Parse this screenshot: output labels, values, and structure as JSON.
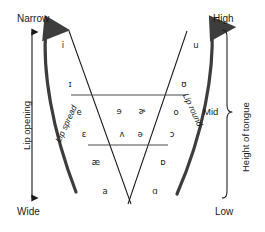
{
  "diagram": {
    "corner_labels": {
      "top_left": "Narrow",
      "bottom_left": "Wide",
      "top_right": "High",
      "bottom_right": "Low"
    },
    "axis_labels": {
      "left": "Lip opening",
      "right": "Height of tongue"
    },
    "band_labels": {
      "mid": "Mid"
    },
    "curve_labels": {
      "left": "Lip spread",
      "right": "Lip round"
    },
    "colors": {
      "stroke": "#1a1a1a",
      "thick_curve": "#3d3d3d",
      "divider": "#4a4a4a",
      "background": "#ffffff",
      "text": "#1a1a1a"
    },
    "vowels": [
      {
        "symbol": "i",
        "name": "close-front-unrounded",
        "x": 63,
        "y": 45
      },
      {
        "symbol": "u",
        "name": "close-back-rounded",
        "x": 196,
        "y": 45
      },
      {
        "symbol": "ɪ",
        "name": "near-close-front-unrounded",
        "x": 70,
        "y": 84
      },
      {
        "symbol": "ʊ",
        "name": "near-close-back-rounded",
        "x": 184,
        "y": 84
      },
      {
        "symbol": "e",
        "name": "close-mid-front-unrounded",
        "x": 79,
        "y": 112
      },
      {
        "symbol": "ɘ",
        "name": "close-mid-central-unrounded",
        "x": 119,
        "y": 111
      },
      {
        "symbol": "ɚ",
        "name": "mid-central-r-colored",
        "x": 142,
        "y": 111
      },
      {
        "symbol": "o",
        "name": "close-mid-back-rounded",
        "x": 176,
        "y": 112
      },
      {
        "symbol": "ɛ",
        "name": "open-mid-front-unrounded",
        "x": 84,
        "y": 134
      },
      {
        "symbol": "ʌ",
        "name": "open-mid-back-unrounded",
        "x": 122,
        "y": 134
      },
      {
        "symbol": "ə",
        "name": "mid-central-schwa",
        "x": 140,
        "y": 134
      },
      {
        "symbol": "ɔ",
        "name": "open-mid-back-rounded",
        "x": 172,
        "y": 134
      },
      {
        "symbol": "æ",
        "name": "near-open-front-unrounded",
        "x": 96,
        "y": 162
      },
      {
        "symbol": "ɒ",
        "name": "open-back-rounded",
        "x": 163,
        "y": 162
      },
      {
        "symbol": "a",
        "name": "open-front-unrounded",
        "x": 105,
        "y": 191
      },
      {
        "symbol": "ɑ",
        "name": "open-back-unrounded",
        "x": 155,
        "y": 191
      }
    ]
  }
}
